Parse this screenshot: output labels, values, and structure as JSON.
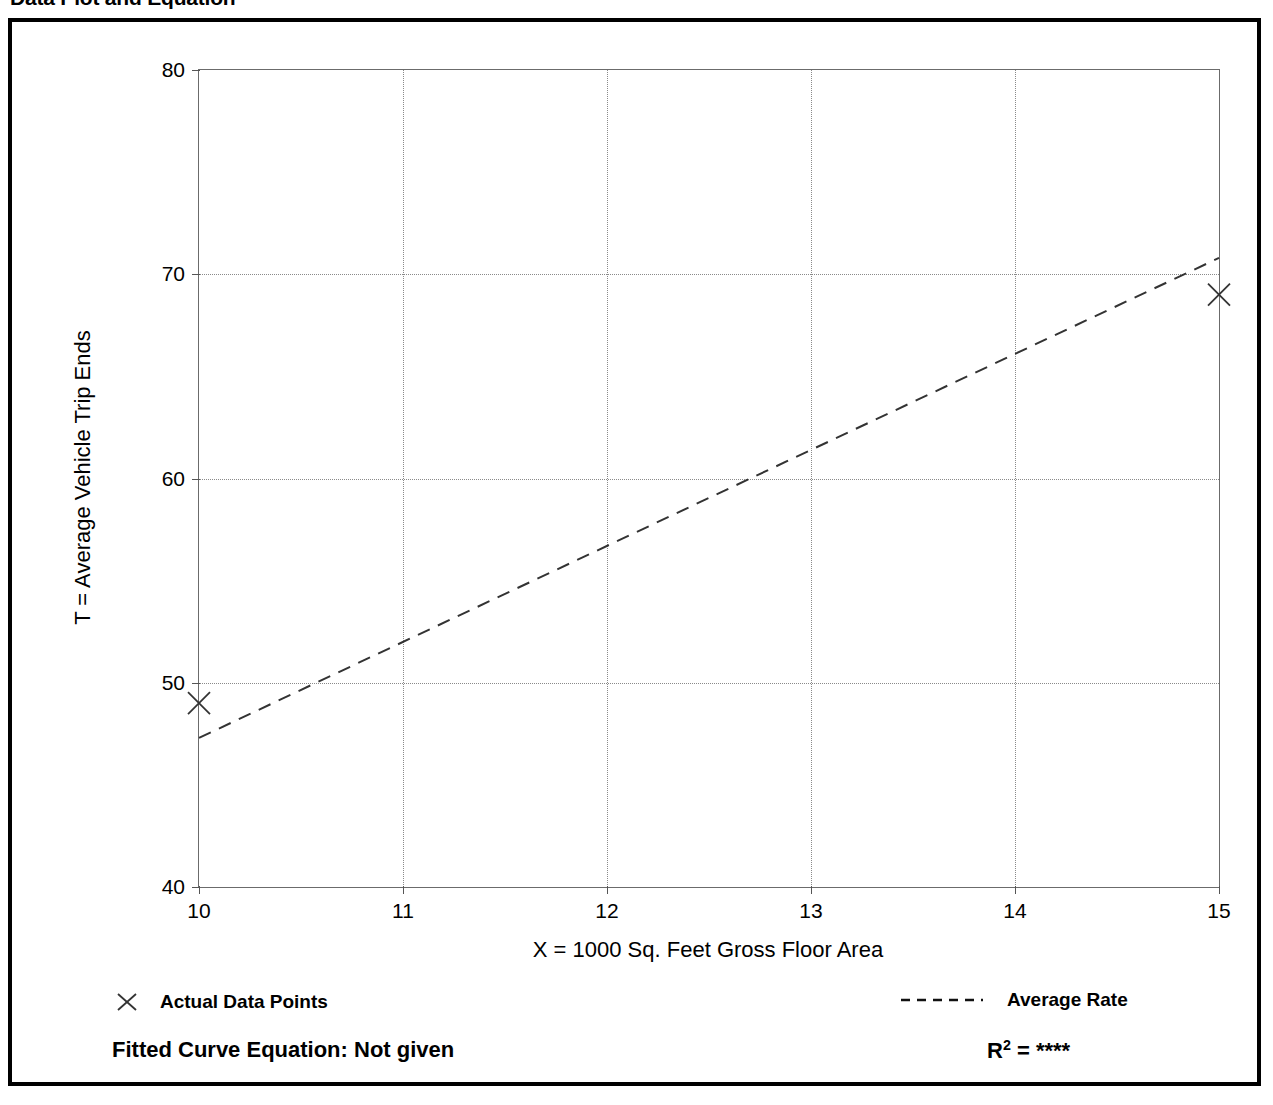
{
  "header": {
    "title": "Data Plot and Equation",
    "right_note": ""
  },
  "chart_data": {
    "type": "scatter",
    "title": "",
    "xlabel": "X = 1000 Sq. Feet Gross Floor Area",
    "ylabel": "T = Average Vehicle Trip Ends",
    "xlim": [
      10,
      15
    ],
    "ylim": [
      40,
      80
    ],
    "xticks": [
      10,
      11,
      12,
      13,
      14,
      15
    ],
    "xtick_labels": [
      "10",
      "11",
      "12",
      "13",
      "14",
      "15"
    ],
    "yticks": [
      40,
      50,
      60,
      70,
      80
    ],
    "ytick_labels": [
      "40",
      "50",
      "60",
      "70",
      "80"
    ],
    "grid": true,
    "grid_style": "dotted",
    "legend_position": "below-axes",
    "series": [
      {
        "name": "Actual Data Points",
        "type": "scatter",
        "marker": "x",
        "points": [
          {
            "x": 10,
            "y": 49
          },
          {
            "x": 15,
            "y": 69
          }
        ]
      },
      {
        "name": "Average Rate",
        "type": "line",
        "style": "dashed",
        "points": [
          {
            "x": 10,
            "y": 47.3
          },
          {
            "x": 15,
            "y": 70.8
          }
        ]
      }
    ],
    "annotations": {
      "fitted_curve_equation": "Fitted Curve Equation:  Not given",
      "r_squared_label": "R",
      "r_squared_exponent": "2",
      "r_squared_equals": " = ",
      "r_squared_value": "****"
    }
  },
  "legend": {
    "points_label": "Actual Data Points",
    "rate_label": "Average Rate"
  },
  "colors": {
    "frame": "#000000",
    "axis": "#555555",
    "grid": "#8a8a8a",
    "series": "#333333",
    "text": "#000000"
  }
}
